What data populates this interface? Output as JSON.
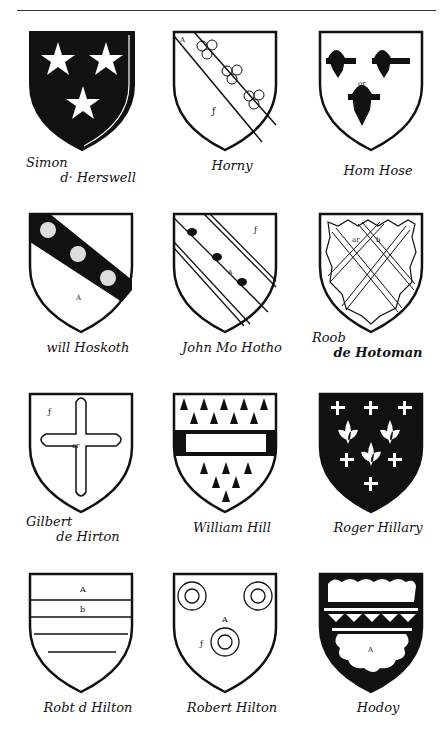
{
  "page": {
    "rule": true,
    "shields": [
      {
        "id": "simon-de-herswell",
        "caption_line1": "Simon",
        "caption_line2": "d· Herswell",
        "field": "#111",
        "charges": "three mullets",
        "tincture_label": "or"
      },
      {
        "id": "horny",
        "caption_line1": "Horny",
        "caption_line2": "",
        "field": "#fff",
        "charges": "bend with three trefoils slipped",
        "tincture_label": "A"
      },
      {
        "id": "hom-hose",
        "caption_line1": "Hom Hose",
        "caption_line2": "",
        "field": "#fff",
        "charges": "three eagles displayed",
        "tincture_label": "or"
      },
      {
        "id": "will-hoskoth",
        "caption_line1": "will Hoskoth",
        "caption_line2": "",
        "field": "#fff",
        "charges": "bend sable with three garbs",
        "tincture_label": "A"
      },
      {
        "id": "john-mo-hotho",
        "caption_line1": "John Mo Hotho",
        "caption_line2": "",
        "field": "#fff",
        "charges": "bend cotised with three birds",
        "tincture_label": "A"
      },
      {
        "id": "rob-de-hotoman",
        "caption_line1": "Roob",
        "caption_line2": "de Hotoman",
        "field": "#fff",
        "charges": "fretty within bordure indented",
        "tincture_label": "ar b"
      },
      {
        "id": "gilbert-de-hirton",
        "caption_line1": "Gilbert",
        "caption_line2": "de Hirton",
        "field": "#fff",
        "charges": "cross flory",
        "tincture_label": "or"
      },
      {
        "id": "william-hill",
        "caption_line1": "William Hill",
        "caption_line2": "",
        "field": "#fff",
        "charges": "ermine, fess embattled with castle",
        "tincture_label": "A"
      },
      {
        "id": "roger-hillary",
        "caption_line1": "Roger Hillary",
        "caption_line2": "",
        "field": "#111",
        "charges": "fleurs-de-lis and crosslets",
        "tincture_label": "A"
      },
      {
        "id": "rob-de-hilton",
        "caption_line1": "Robt d Hilton",
        "caption_line2": "",
        "field": "#fff",
        "charges": "barry",
        "tincture_label": "A b"
      },
      {
        "id": "robert-hilton",
        "caption_line1": "Robert Hilton",
        "caption_line2": "",
        "field": "#fff",
        "charges": "three annulets",
        "tincture_label": "A"
      },
      {
        "id": "hodoy",
        "caption_line1": "Hodoy",
        "caption_line2": "",
        "field": "#111",
        "charges": "fess dancetty, bordure engrailed",
        "tincture_label": "A"
      }
    ]
  }
}
